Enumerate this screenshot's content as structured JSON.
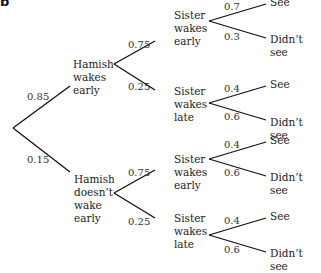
{
  "part_label": "b",
  "tree": {
    "root": {
      "branches": [
        {
          "probability": "0.85",
          "label": "Hamish\nwakes\nearly",
          "branches": [
            {
              "probability": "0.75",
              "label": "Sister\nwakes\nearly",
              "branches": [
                {
                  "probability": "0.7",
                  "label": "See"
                },
                {
                  "probability": "0.3",
                  "label": "Didn’t see"
                }
              ]
            },
            {
              "probability": "0.25",
              "label": "Sister\nwakes\nlate",
              "branches": [
                {
                  "probability": "0.4",
                  "label": "See"
                },
                {
                  "probability": "0.6",
                  "label": "Didn’t see"
                }
              ]
            }
          ]
        },
        {
          "probability": "0.15",
          "label": "Hamish\ndoesn’t\nwake\nearly",
          "branches": [
            {
              "probability": "0.75",
              "label": "Sister\nwakes\nearly",
              "branches": [
                {
                  "probability": "0.4",
                  "label": "See"
                },
                {
                  "probability": "0.6",
                  "label": "Didn’t see"
                }
              ]
            },
            {
              "probability": "0.25",
              "label": "Sister\nwakes\nlate",
              "branches": [
                {
                  "probability": "0.4",
                  "label": "See"
                },
                {
                  "probability": "0.6",
                  "label": "Didn’t see"
                }
              ]
            }
          ]
        }
      ]
    }
  }
}
